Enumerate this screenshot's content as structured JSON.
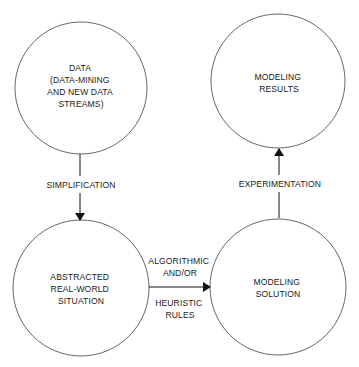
{
  "diagram": {
    "colors": {
      "stroke": "#555555",
      "text": "#1a1a1a",
      "arrow": "#111111",
      "background": "#ffffff"
    },
    "nodes": [
      {
        "id": "data",
        "lines": [
          "DATA",
          "(DATA-MINING",
          "AND NEW DATA",
          "STREAMS)"
        ]
      },
      {
        "id": "modeling-results",
        "lines": [
          "MODELING",
          "RESULTS"
        ]
      },
      {
        "id": "abstracted",
        "lines": [
          "ABSTRACTED",
          "REAL-WORLD",
          "SITUATION"
        ]
      },
      {
        "id": "modeling-solution",
        "lines": [
          "MODELING",
          "SOLUTION"
        ]
      }
    ],
    "edges": [
      {
        "from": "data",
        "to": "abstracted",
        "label_lines": [
          "SIMPLIFICATION"
        ]
      },
      {
        "from": "abstracted",
        "to": "modeling-solution",
        "label_above": [
          "ALGORITHMIC",
          "AND/OR"
        ],
        "label_below": [
          "HEURISTIC",
          "RULES"
        ]
      },
      {
        "from": "modeling-solution",
        "to": "modeling-results",
        "label_lines": [
          "EXPERIMENTATION"
        ]
      }
    ]
  }
}
